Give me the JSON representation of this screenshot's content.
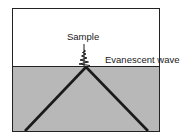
{
  "diagram": {
    "labels": {
      "sample": "Sample",
      "evanescent_wave": "Evanescent wave"
    },
    "colors": {
      "upper_medium": "#ffffff",
      "lower_medium": "#b8b8b8",
      "beam": "#1a1a1a",
      "frame": "#222222"
    }
  }
}
